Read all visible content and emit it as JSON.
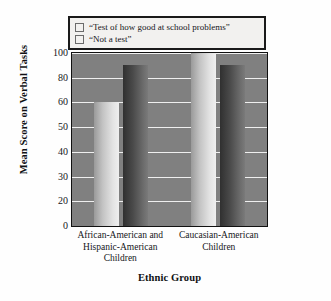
{
  "chart_data": {
    "type": "bar",
    "title": "",
    "subtitle": "",
    "xlabel": "Ethnic Group",
    "ylabel": "Mean Score on Verbal Tasks",
    "categories": [
      "African-American and Hispanic-American Children",
      "Caucasian-American Children"
    ],
    "category_lines": [
      [
        "African-American and",
        "Hispanic-American",
        "Children"
      ],
      [
        "Caucasian-American",
        "Children"
      ]
    ],
    "series": [
      {
        "name": "“Test of how good at school problems”",
        "color": "#d8d8d8",
        "values": [
          60,
          100
        ]
      },
      {
        "name": "“Not a test”",
        "color": "#262626",
        "values": [
          90,
          90
        ]
      }
    ],
    "ytick_labels": [
      "0",
      "20",
      "30",
      "40",
      "50",
      "60",
      "80",
      "100"
    ],
    "ytick_values": [
      0,
      20,
      30,
      40,
      50,
      60,
      80,
      100
    ],
    "ylim": [
      0,
      100
    ],
    "y_scale": "ordinal-evenly-spaced",
    "grid": true,
    "grid_color": "#f4f4f4",
    "plot_background": "#808080",
    "legend_position": "above-plot",
    "legend_border_color": "#1a1a1a"
  },
  "legend": {
    "items": [
      {
        "label": "“Test of how good at school problems”",
        "swatch": "light-gray"
      },
      {
        "label": "“Not a test”",
        "swatch": "dark-gray"
      }
    ]
  },
  "axes": {
    "y_title": "Mean Score on Verbal Tasks",
    "x_title": "Ethnic Group"
  }
}
